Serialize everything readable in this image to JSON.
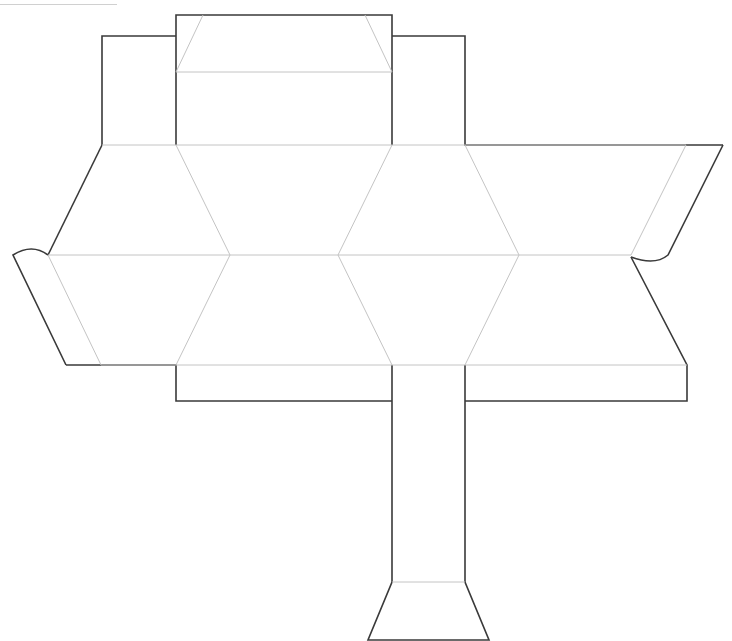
{
  "diagram": {
    "type": "papercraft-net",
    "caption": "",
    "colors": {
      "cut_line": "#3a3a3a",
      "fold_line": "#c4c4c4",
      "background": "#ffffff"
    },
    "legend": {
      "cut": "solid dark outline",
      "fold": "thin light gray"
    }
  }
}
